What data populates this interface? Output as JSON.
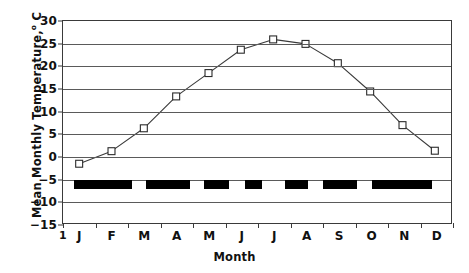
{
  "axes": {
    "y_title_main": "Mean Monthly Temperature,",
    "y_title_deg": "o",
    "y_title_unit": " C",
    "x_title": "Month",
    "y_ticks": [
      "30",
      "25",
      "20",
      "15",
      "10",
      "5",
      "0",
      "-5",
      "-10",
      "-15"
    ],
    "x_origin_label": "1",
    "x_ticks": [
      "J",
      "F",
      "M",
      "A",
      "M",
      "J",
      "J",
      "A",
      "S",
      "O",
      "N",
      "D"
    ]
  },
  "colors": {
    "axis": "#3a3a3a",
    "grid": "#5a5a5a",
    "line": "#3a3a3a",
    "marker_fill": "#ffffff",
    "marker_stroke": "#2a2a2a",
    "bar": "#000000",
    "background": "#ffffff"
  },
  "chart_data": {
    "type": "line",
    "title": "",
    "xlabel": "Month",
    "ylabel": "Mean Monthly Temperature, o C",
    "categories": [
      "J",
      "F",
      "M",
      "A",
      "M",
      "J",
      "J",
      "A",
      "S",
      "O",
      "N",
      "D"
    ],
    "values": [
      -1.8,
      1.0,
      6.1,
      13.2,
      18.4,
      23.6,
      25.9,
      24.9,
      20.6,
      14.3,
      6.8,
      1.1
    ],
    "series": [
      {
        "name": "Mean Monthly Temperature",
        "values": [
          -1.8,
          1.0,
          6.1,
          13.2,
          18.4,
          23.6,
          25.9,
          24.9,
          20.6,
          14.3,
          6.8,
          1.1
        ],
        "marker": "open-square",
        "line_style": "solid"
      }
    ],
    "ylim": [
      -15,
      30
    ],
    "ytick_step": 5,
    "xlim": [
      0,
      12
    ],
    "grid": "horizontal",
    "legend": "none",
    "annotation_bars": {
      "description": "black horizontal blocks drawn between -5 and -7 along the month axis",
      "y_top": -5.0,
      "y_bottom": -7.0,
      "segments": [
        {
          "x_start": 0.33,
          "x_end": 2.12
        },
        {
          "x_start": 2.56,
          "x_end": 3.92
        },
        {
          "x_start": 4.33,
          "x_end": 5.12
        },
        {
          "x_start": 5.6,
          "x_end": 6.12
        },
        {
          "x_start": 6.82,
          "x_end": 7.55
        },
        {
          "x_start": 8.0,
          "x_end": 9.05
        },
        {
          "x_start": 9.52,
          "x_end": 11.35
        }
      ]
    }
  }
}
